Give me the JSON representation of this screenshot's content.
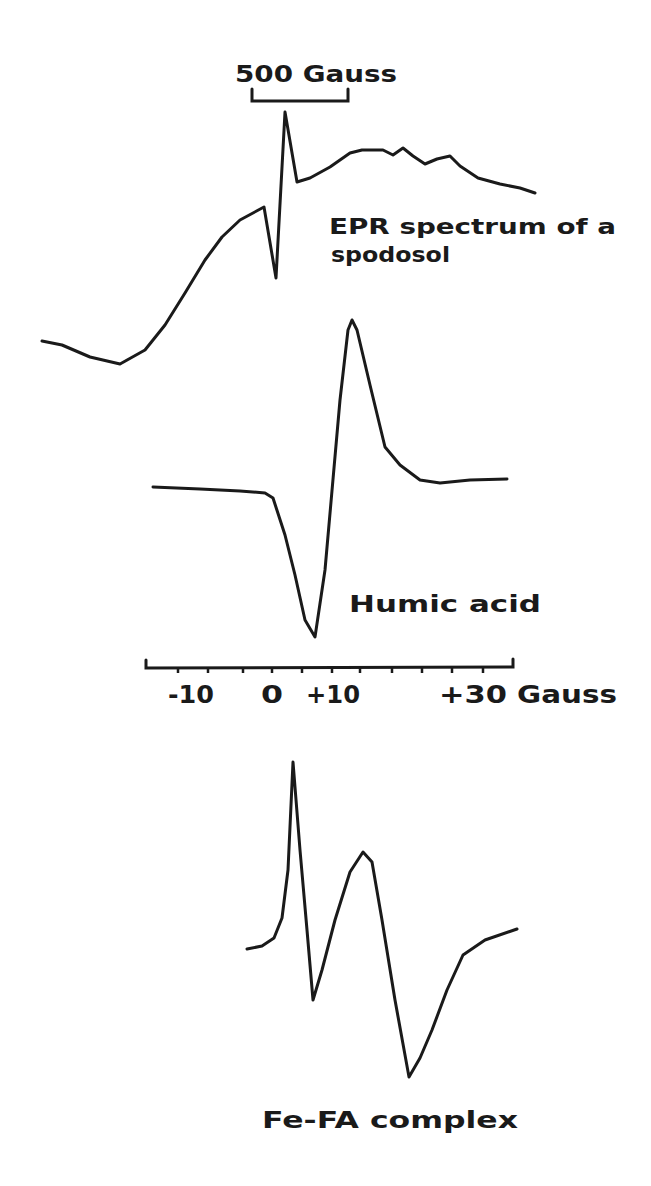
{
  "chart_data": {
    "type": "line",
    "title": "",
    "panels": [
      {
        "name": "spodosol",
        "label_line1": "EPR spectrum of a",
        "label_line2": "spodosol",
        "scale_bar_label": "500 Gauss",
        "description": "Broad rising EPR derivative spectrum with a sharp free-radical signal (dip then spike) near the scale bar",
        "points": [
          [
            42,
            341
          ],
          [
            62,
            345
          ],
          [
            90,
            357
          ],
          [
            120,
            364
          ],
          [
            145,
            350
          ],
          [
            165,
            325
          ],
          [
            185,
            293
          ],
          [
            205,
            260
          ],
          [
            222,
            237
          ],
          [
            240,
            220
          ],
          [
            264,
            207
          ],
          [
            276,
            278
          ],
          [
            285,
            112
          ],
          [
            297,
            182
          ],
          [
            310,
            178
          ],
          [
            330,
            167
          ],
          [
            350,
            153
          ],
          [
            362,
            150
          ],
          [
            383,
            150
          ],
          [
            393,
            155
          ],
          [
            403,
            148
          ],
          [
            413,
            156
          ],
          [
            425,
            164
          ],
          [
            437,
            159
          ],
          [
            450,
            156
          ],
          [
            460,
            166
          ],
          [
            478,
            178
          ],
          [
            500,
            184
          ],
          [
            520,
            188
          ],
          [
            535,
            193
          ]
        ]
      },
      {
        "name": "humic-acid",
        "label": "Humic acid",
        "description": "Single derivative EPR line: trough near +7 Gauss, peak near +13 Gauss",
        "points": [
          [
            153,
            487
          ],
          [
            200,
            489
          ],
          [
            240,
            491
          ],
          [
            265,
            493
          ],
          [
            273,
            498
          ],
          [
            285,
            535
          ],
          [
            295,
            575
          ],
          [
            305,
            620
          ],
          [
            315,
            637
          ],
          [
            325,
            570
          ],
          [
            340,
            400
          ],
          [
            348,
            330
          ],
          [
            352,
            320
          ],
          [
            357,
            330
          ],
          [
            370,
            385
          ],
          [
            385,
            447
          ],
          [
            400,
            465
          ],
          [
            420,
            480
          ],
          [
            440,
            483
          ],
          [
            470,
            480
          ],
          [
            507,
            479
          ]
        ]
      },
      {
        "name": "fe-fa-complex",
        "label": "Fe-FA complex",
        "description": "Two overlapping derivative lines: sharp peak then trough, followed by broader peak and deeper trough",
        "points": [
          [
            247,
            949
          ],
          [
            262,
            946
          ],
          [
            274,
            938
          ],
          [
            282,
            918
          ],
          [
            288,
            870
          ],
          [
            293,
            762
          ],
          [
            300,
            850
          ],
          [
            307,
            930
          ],
          [
            313,
            1000
          ],
          [
            322,
            970
          ],
          [
            335,
            920
          ],
          [
            350,
            872
          ],
          [
            363,
            852
          ],
          [
            372,
            862
          ],
          [
            382,
            920
          ],
          [
            395,
            1000
          ],
          [
            409,
            1077
          ],
          [
            420,
            1058
          ],
          [
            432,
            1030
          ],
          [
            447,
            990
          ],
          [
            463,
            955
          ],
          [
            485,
            940
          ],
          [
            517,
            929
          ]
        ]
      }
    ],
    "xaxis": {
      "label": "Gauss",
      "tick_labels": [
        "-10",
        "0",
        "+10",
        "+30 Gauss"
      ],
      "tick_values": [
        -10,
        0,
        10,
        30
      ],
      "minor_tick_step": 5,
      "range": [
        -20,
        40
      ]
    },
    "xlabel": "Gauss",
    "ylabel": "",
    "grid": false,
    "legend": "none (inline labels)"
  },
  "labels": {
    "scale_bar": "500 Gauss",
    "spodosol_line1": "EPR spectrum of a",
    "spodosol_line2": "spodosol",
    "humic": "Humic acid",
    "fefa": "Fe-FA complex",
    "tick_m10": "-10",
    "tick_0": "0",
    "tick_p10": "+10",
    "tick_p30": "+30",
    "axis_unit": "Gauss"
  }
}
